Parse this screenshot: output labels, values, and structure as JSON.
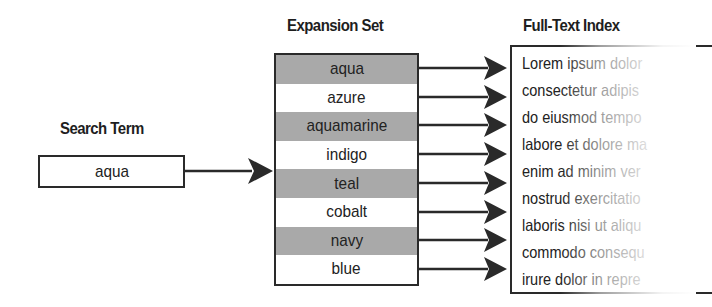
{
  "search": {
    "title": "Search Term",
    "term": "aqua"
  },
  "expansion": {
    "title": "Expansion Set",
    "terms": [
      "aqua",
      "azure",
      "aquamarine",
      "indigo",
      "teal",
      "cobalt",
      "navy",
      "blue"
    ]
  },
  "index": {
    "title": "Full-Text Index",
    "lines": [
      "Lorem ipsum dolor",
      "consectetur adipis",
      "do eiusmod tempo",
      "labore et dolore ma",
      "enim ad minim ver",
      "nostrud exercitatio",
      "laboris nisi ut aliqu",
      "commodo consequ",
      "irure dolor in repre"
    ]
  },
  "colors": {
    "line": "#2a2a2a",
    "shaded_row": "#a9a9a9",
    "background": "#ffffff"
  }
}
